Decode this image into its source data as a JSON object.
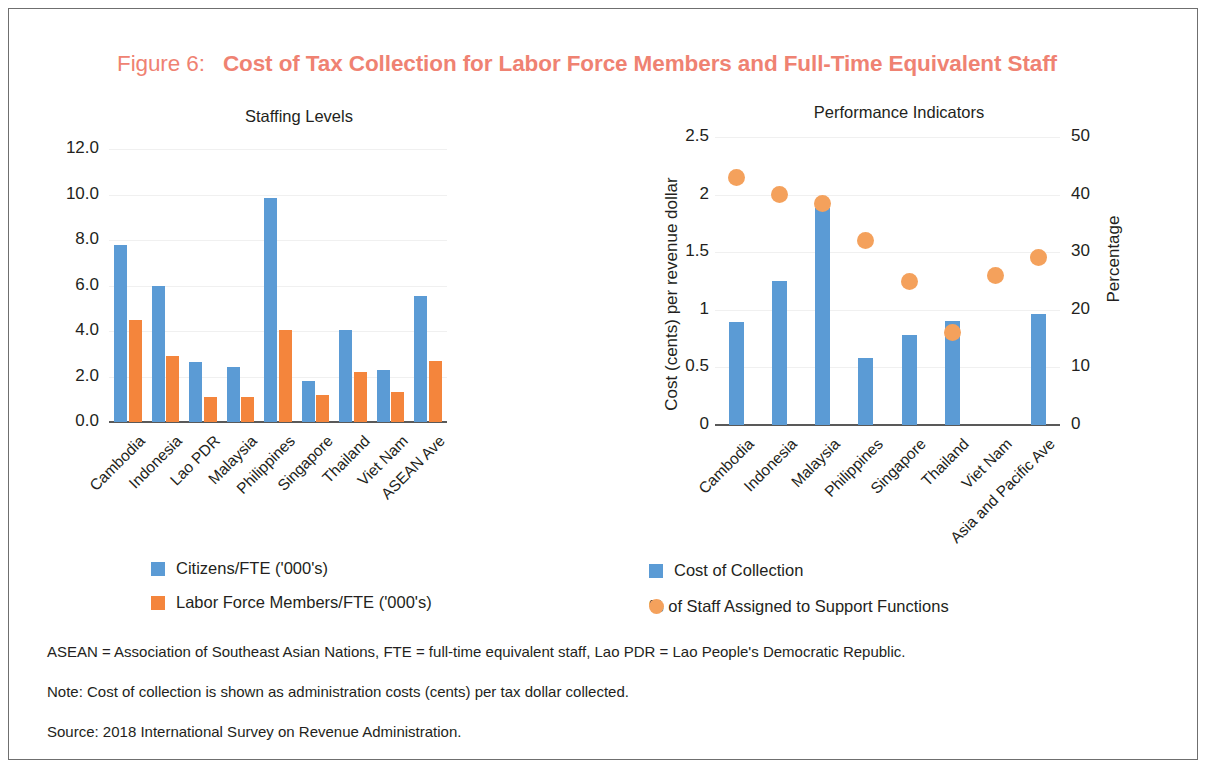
{
  "figure": {
    "label": "Figure 6:",
    "title": "Cost of Tax Collection for Labor Force Members and Full-Time Equivalent Staff",
    "title_color": "#ef8272"
  },
  "colors": {
    "blue": "#5b9bd5",
    "orange_bar": "#f4853c",
    "orange_dot": "#f4a15c",
    "axis": "#595959",
    "grid": "#f0f0f0",
    "text": "#231f20"
  },
  "legends": {
    "left": [
      {
        "marker": "square-blue",
        "label": "Citizens/FTE ('000's)"
      },
      {
        "marker": "square-orange",
        "label": "Labor Force Members/FTE ('000's)"
      }
    ],
    "right": [
      {
        "marker": "square-blue",
        "label": "Cost of Collection"
      },
      {
        "marker": "circle-orange",
        "label": "% of Staff Assigned to Support Functions"
      }
    ]
  },
  "footnotes": [
    "ASEAN = Association of Southeast Asian Nations, FTE = full-time equivalent staff, Lao PDR = Lao People's Democratic Republic.",
    "Note: Cost of collection is shown as administration costs (cents) per tax dollar collected.",
    "Source: 2018 International Survey on Revenue Administration."
  ],
  "chart_data": [
    {
      "id": "staffing-levels",
      "type": "bar",
      "title": "Staffing Levels",
      "xlabel": "",
      "ylabel": "",
      "ylim": [
        0,
        12
      ],
      "yticks": [
        "0.0",
        "2.0",
        "4.0",
        "6.0",
        "8.0",
        "10.0",
        "12.0"
      ],
      "ytick_values": [
        0,
        2,
        4,
        6,
        8,
        10,
        12
      ],
      "grid": true,
      "legend_position": "bottom-left",
      "categories": [
        "Cambodia",
        "Indonesia",
        "Lao PDR",
        "Malaysia",
        "Philippines",
        "Singapore",
        "Thailand",
        "Viet Nam",
        "ASEAN Ave"
      ],
      "series": [
        {
          "name": "Citizens/FTE ('000's)",
          "color": "#5b9bd5",
          "values": [
            7.8,
            6.0,
            2.65,
            2.4,
            9.85,
            1.8,
            4.05,
            2.3,
            5.55
          ]
        },
        {
          "name": "Labor Force Members/FTE ('000's)",
          "color": "#f4853c",
          "values": [
            4.5,
            2.9,
            1.1,
            1.1,
            4.05,
            1.2,
            2.2,
            1.3,
            2.7
          ]
        }
      ]
    },
    {
      "id": "performance-indicators",
      "type": "bar",
      "title": "Performance Indicators",
      "xlabel": "",
      "ylabel": "Cost (cents) per revenue dollar",
      "y2label": "Percentage",
      "ylim": [
        0,
        2.5
      ],
      "yticks": [
        "0",
        "0.5",
        "1",
        "1.5",
        "2",
        "2.5"
      ],
      "ytick_values": [
        0,
        0.5,
        1,
        1.5,
        2,
        2.5
      ],
      "y2lim": [
        0,
        50
      ],
      "y2ticks": [
        "0",
        "10",
        "20",
        "30",
        "40",
        "50"
      ],
      "y2tick_values": [
        0,
        10,
        20,
        30,
        40,
        50
      ],
      "grid": true,
      "legend_position": "bottom-left",
      "categories": [
        "Cambodia",
        "Indonesia",
        "Malaysia",
        "Philippines",
        "Singapore",
        "Thailand",
        "Viet Nam",
        "Asia and Pacific Ave"
      ],
      "series": [
        {
          "name": "Cost of Collection",
          "color": "#5b9bd5",
          "axis": "left",
          "render": "bar",
          "values": [
            0.89,
            1.25,
            1.88,
            0.58,
            0.78,
            0.9,
            null,
            0.96
          ]
        },
        {
          "name": "% of Staff Assigned to Support Functions",
          "color": "#f4a15c",
          "axis": "right",
          "render": "scatter",
          "values": [
            43,
            40,
            38.5,
            32,
            25,
            16,
            26,
            29
          ]
        }
      ]
    }
  ]
}
